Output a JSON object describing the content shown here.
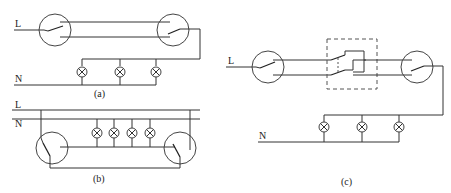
{
  "diagrams": [
    {
      "id": "a",
      "caption": "(a)",
      "line_label": "L",
      "neutral_label": "N",
      "switches": 2,
      "lamps": 3
    },
    {
      "id": "b",
      "caption": "(b)",
      "line_label": "L",
      "neutral_label": "N",
      "switches": 2,
      "lamps": 4
    },
    {
      "id": "c",
      "caption": "(c)",
      "line_label": "L",
      "neutral_label": "N",
      "switches": 2,
      "intermediate_switch": 1,
      "lamps": 3
    }
  ],
  "colors": {
    "line": "#333333",
    "background": "#ffffff"
  }
}
